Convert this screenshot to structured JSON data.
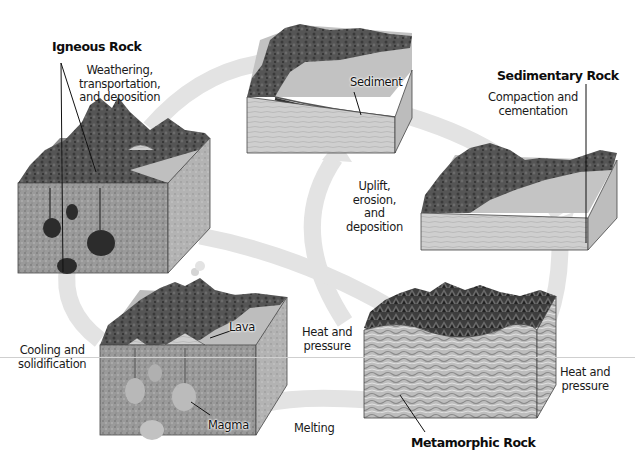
{
  "colors": {
    "arrow": "#e3e3e3",
    "rock_top_dark": "#4a4a4a",
    "rock_side": "#a8a8a8",
    "sediment_side": "#c8c8c8",
    "outline": "#333333",
    "background": "#ffffff"
  },
  "rock_types": {
    "igneous": {
      "label": "Igneous Rock"
    },
    "sedimentary": {
      "label": "Sedimentary Rock"
    },
    "metamorphic": {
      "label": "Metamorphic Rock"
    }
  },
  "blocks": {
    "sediment": {
      "callout": "Sediment"
    },
    "volcano": {
      "callout_lava": "Lava",
      "callout_magma": "Magma"
    }
  },
  "processes": {
    "weathering": [
      "Weathering,",
      "transportation,",
      "and deposition"
    ],
    "compaction": [
      "Compaction and",
      "cementation"
    ],
    "uplift": [
      "Uplift,",
      "erosion,",
      "and",
      "deposition"
    ],
    "heat_pressure_left": [
      "Heat and",
      "pressure"
    ],
    "heat_pressure_right": [
      "Heat and",
      "pressure"
    ],
    "cooling": [
      "Cooling and",
      "solidification"
    ],
    "melting": [
      "Melting"
    ]
  },
  "diagram_nodes": [
    {
      "id": "igneous",
      "label": "Igneous Rock"
    },
    {
      "id": "sediment",
      "label": "Sediment"
    },
    {
      "id": "sedimentary",
      "label": "Sedimentary Rock"
    },
    {
      "id": "metamorphic",
      "label": "Metamorphic Rock"
    },
    {
      "id": "magma",
      "label": "Magma"
    }
  ],
  "diagram_edges": [
    {
      "from": "igneous",
      "to": "sediment",
      "label": "Weathering, transportation, and deposition"
    },
    {
      "from": "sediment",
      "to": "sedimentary",
      "label": "Compaction and cementation"
    },
    {
      "from": "metamorphic",
      "to": "sediment",
      "label": "Uplift, erosion, and deposition"
    },
    {
      "from": "igneous",
      "to": "metamorphic",
      "label": "Heat and pressure"
    },
    {
      "from": "sedimentary",
      "to": "metamorphic",
      "label": "Heat and pressure"
    },
    {
      "from": "metamorphic",
      "to": "magma",
      "label": "Melting"
    },
    {
      "from": "magma",
      "to": "igneous",
      "label": "Cooling and solidification"
    }
  ]
}
